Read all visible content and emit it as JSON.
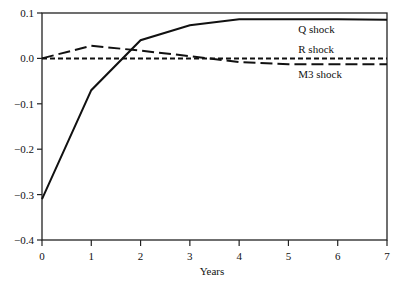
{
  "chart_data": {
    "type": "line",
    "title": "",
    "xlabel": "Years",
    "ylabel": "",
    "x": [
      0,
      1,
      2,
      3,
      4,
      5,
      6,
      7
    ],
    "xlim": [
      0,
      7
    ],
    "ylim": [
      -0.4,
      0.1
    ],
    "xticks": [
      "0",
      "1",
      "2",
      "3",
      "4",
      "5",
      "6",
      "7"
    ],
    "yticks": [
      "0.1",
      "0.0",
      "−0.1",
      "−0.2",
      "−0.3",
      "−0.4"
    ],
    "ytick_values": [
      0.1,
      0.0,
      -0.1,
      -0.2,
      -0.3,
      -0.4
    ],
    "grid": false,
    "legend_position": "inline labels near right end of each line",
    "series": [
      {
        "name": "Q shock",
        "style": "solid",
        "values": [
          -0.31,
          -0.07,
          0.04,
          0.073,
          0.086,
          0.086,
          0.086,
          0.085
        ]
      },
      {
        "name": "R shock",
        "style": "short-dash",
        "values": [
          0.0,
          0.0,
          0.0,
          0.0,
          0.0,
          0.0,
          0.0,
          0.0
        ]
      },
      {
        "name": "M3 shock",
        "style": "long-dash",
        "values": [
          0.0,
          0.028,
          0.017,
          0.005,
          -0.008,
          -0.013,
          -0.013,
          -0.013
        ]
      }
    ],
    "annotations": [
      {
        "text": "Q shock",
        "x": 5.2,
        "y": 0.065
      },
      {
        "text": "R shock",
        "x": 5.2,
        "y": 0.02
      },
      {
        "text": "M3 shock",
        "x": 5.2,
        "y": -0.035
      }
    ]
  }
}
